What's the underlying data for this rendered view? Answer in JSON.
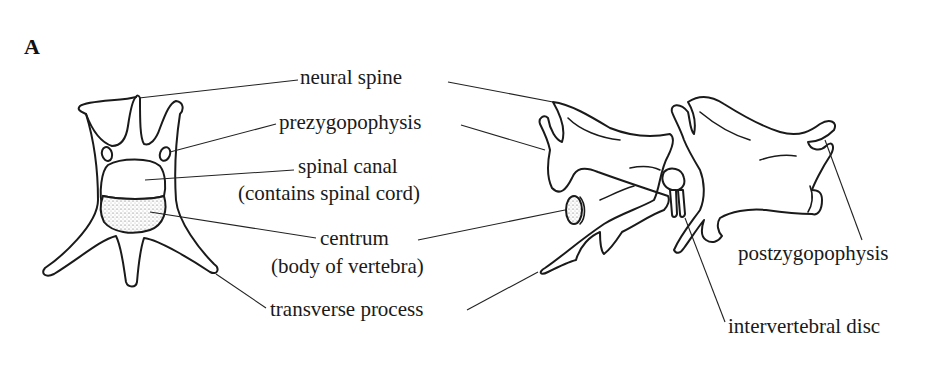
{
  "figure": {
    "panel_label": "A",
    "colors": {
      "background": "#ffffff",
      "ink": "#1a1a1a",
      "stipple": "#555555"
    }
  },
  "labels": {
    "neural_spine": "neural spine",
    "prezygopophysis": "prezygopophysis",
    "spinal_canal": "spinal canal",
    "spinal_canal_note": "(contains spinal cord)",
    "centrum": "centrum",
    "centrum_note": "(body of vertebra)",
    "transverse_process": "transverse process",
    "postzygopophysis": "postzygopophysis",
    "intervertebral_disc": "intervertebral disc"
  }
}
